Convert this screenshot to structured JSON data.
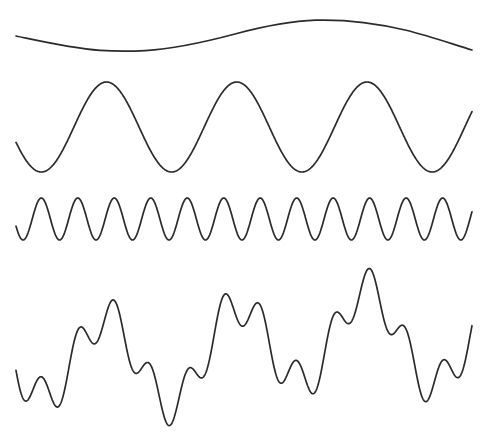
{
  "figure": {
    "name": "wave-superposition-figure",
    "width": 490,
    "height": 437,
    "background_color": "#ffffff",
    "stroke_color": "#2b2b2b",
    "stroke_width": 1.7
  },
  "chart_data": {
    "type": "line",
    "title": "",
    "subtitle": "",
    "xlabel": "",
    "ylabel": "",
    "grid": false,
    "legend": "none",
    "axes_visible": false,
    "tick_labels": [],
    "annotations": [],
    "x_domain": [
      0,
      1
    ],
    "x_pixel_range": [
      16,
      472
    ],
    "series": [
      {
        "name": "wave-1-low-frequency",
        "role": "component",
        "cycles": 1,
        "amplitude_px": 15,
        "baseline_y_px": 35,
        "phase_deg": 180,
        "y_extent_px": [
          20,
          51
        ],
        "start_point_px": [
          16,
          36
        ],
        "end_point_px": [
          472,
          50
        ],
        "trough_px": [
          134,
          51
        ],
        "peak_px": [
          316,
          20
        ],
        "path": "M16,36 C40,41 70,48 100,50.4 C118,51.6 128,51.6 145,50.6 C175,48.8 205,42 235,34 C265,26 290,21 316,20.2 C345,19.4 375,23 405,30 C430,36 455,45 472,50"
      },
      {
        "name": "wave-2-mid-frequency",
        "role": "component",
        "cycles": 3.5,
        "amplitude_px": 45,
        "baseline_y_px": 127,
        "phase_deg": 200,
        "y_extent_px": [
          82,
          173
        ],
        "start_point_px": [
          16,
          133
        ],
        "end_point_px": [
          472,
          82
        ],
        "peaks_px": [
          [
            105,
            82
          ],
          [
            238,
            82
          ],
          [
            345,
            82
          ]
        ],
        "troughs_px": [
          [
            42,
            173
          ],
          [
            172,
            173
          ],
          [
            292,
            173
          ],
          [
            412,
            173
          ]
        ],
        "period_px": 130
      },
      {
        "name": "wave-3-high-frequency",
        "role": "component",
        "cycles": 12.5,
        "amplitude_px": 21,
        "baseline_y_px": 219,
        "phase_deg": 200,
        "y_extent_px": [
          197,
          241
        ],
        "start_point_px": [
          16,
          228
        ],
        "end_point_px": [
          472,
          197
        ],
        "period_px": 37
      },
      {
        "name": "wave-4-superposition-sum",
        "role": "sum",
        "components": [
          "wave-1-low-frequency",
          "wave-2-mid-frequency",
          "wave-3-high-frequency"
        ],
        "amplitude_px": 80,
        "baseline_y_px": 348,
        "y_extent_px": [
          268,
          426
        ],
        "start_point_px": [
          16,
          363
        ],
        "end_point_px": [
          472,
          295
        ],
        "highest_peak_px": [
          353,
          268
        ],
        "lowest_trough_px": [
          412,
          426
        ]
      }
    ]
  }
}
